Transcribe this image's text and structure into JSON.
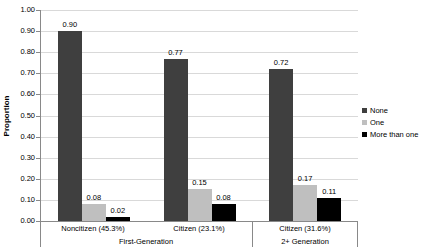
{
  "chart_data": {
    "type": "bar",
    "ylabel": "Proportion",
    "ylim": [
      0,
      1
    ],
    "ytick_step": 0.1,
    "ytick_decimals": 2,
    "grid": true,
    "data_labels": true,
    "legend_position": "right",
    "categories": [
      "Noncitizen (45.3%)",
      "Citizen (23.1%)",
      "Citizen (31.6%)"
    ],
    "category_groups": [
      {
        "label": "First-Generation",
        "span": 2
      },
      {
        "label": "2+ Generation",
        "span": 1
      }
    ],
    "series": [
      {
        "name": "None",
        "color": "#3F3F3F",
        "values": [
          0.9,
          0.77,
          0.72
        ]
      },
      {
        "name": "One",
        "color": "#BFBFBF",
        "values": [
          0.08,
          0.15,
          0.17
        ]
      },
      {
        "name": "More than one",
        "color": "#000000",
        "values": [
          0.02,
          0.08,
          0.11
        ]
      }
    ]
  },
  "colors": {
    "background": "#FFFFFF",
    "gridline": "#D9D9D9",
    "axis": "#898989",
    "text": "#000000"
  }
}
